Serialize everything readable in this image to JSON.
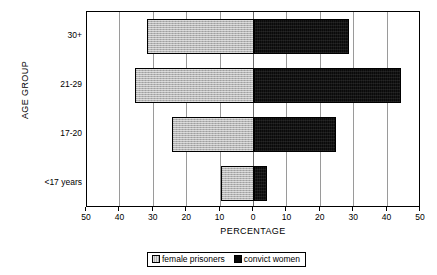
{
  "chart_data": {
    "type": "bar",
    "orientation": "horizontal-diverging",
    "title": "",
    "xlabel": "PERCENTAGE",
    "ylabel": "AGE GROUP",
    "categories": [
      "30+",
      "21-29",
      "17-20",
      "<17 years"
    ],
    "series": [
      {
        "name": "female prisoners",
        "side": "left",
        "color": "#b4b4b4",
        "values": [
          32,
          35.5,
          24.5,
          10
        ]
      },
      {
        "name": "convict women",
        "side": "right",
        "color": "#0a0a0a",
        "values": [
          28.5,
          44,
          24.5,
          4
        ]
      }
    ],
    "xlim": [
      -50,
      50
    ],
    "xticks": [
      -50,
      -40,
      -30,
      -20,
      -10,
      0,
      10,
      20,
      30,
      40,
      50
    ],
    "xticklabels": [
      "50",
      "40",
      "30",
      "20",
      "10",
      "0",
      "10",
      "20",
      "30",
      "40",
      "50"
    ],
    "grid": true,
    "legend_position": "bottom"
  },
  "legend": {
    "items": [
      {
        "label": "female prisoners",
        "swatch": "gray-swatch-icon"
      },
      {
        "label": "convict women",
        "swatch": "black-swatch-icon"
      }
    ]
  }
}
